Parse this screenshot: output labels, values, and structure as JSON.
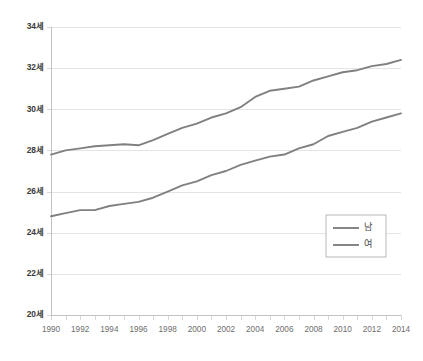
{
  "chart_data": {
    "type": "line",
    "title": "",
    "subtitle": "",
    "xlabel": "",
    "ylabel": "",
    "x": [
      1990,
      1991,
      1992,
      1993,
      1994,
      1995,
      1996,
      1997,
      1998,
      1999,
      2000,
      2001,
      2002,
      2003,
      2004,
      2005,
      2006,
      2007,
      2008,
      2009,
      2010,
      2011,
      2012,
      2013,
      2014
    ],
    "xlim": [
      1990,
      2014
    ],
    "ylim": [
      20,
      34
    ],
    "y_tick_values": [
      20,
      22,
      24,
      26,
      28,
      30,
      32,
      34
    ],
    "y_tick_labels": [
      "20세",
      "22세",
      "24세",
      "26세",
      "28세",
      "30세",
      "32세",
      "34세"
    ],
    "x_tick_labels": [
      "1990",
      "1992",
      "1994",
      "1996",
      "1998",
      "2000",
      "2002",
      "2004",
      "2006",
      "2008",
      "2010",
      "2012",
      "2014"
    ],
    "x_tick_values": [
      1990,
      1992,
      1994,
      1996,
      1998,
      2000,
      2002,
      2004,
      2006,
      2008,
      2010,
      2012,
      2014
    ],
    "x_minor_ticks_every": 1,
    "grid": "horizontal",
    "legend_position": "bottom-right",
    "unit_suffix": "세",
    "series": [
      {
        "name": "남",
        "color": "#808080",
        "values": [
          27.8,
          28.0,
          28.1,
          28.2,
          28.25,
          28.3,
          28.25,
          28.5,
          28.8,
          29.1,
          29.3,
          29.6,
          29.8,
          30.1,
          30.6,
          30.9,
          31.0,
          31.1,
          31.4,
          31.6,
          31.8,
          31.9,
          32.1,
          32.2,
          32.4
        ]
      },
      {
        "name": "여",
        "color": "#808080",
        "values": [
          24.8,
          24.95,
          25.1,
          25.1,
          25.3,
          25.4,
          25.5,
          25.7,
          26.0,
          26.3,
          26.5,
          26.8,
          27.0,
          27.3,
          27.5,
          27.7,
          27.8,
          28.1,
          28.3,
          28.7,
          28.9,
          29.1,
          29.4,
          29.6,
          29.8
        ]
      }
    ],
    "legend": [
      {
        "label": "남",
        "color": "#808080"
      },
      {
        "label": "여",
        "color": "#808080"
      }
    ]
  },
  "layout": {
    "plot_left": 51,
    "plot_right": 401,
    "plot_top": 27,
    "plot_bottom": 315
  }
}
